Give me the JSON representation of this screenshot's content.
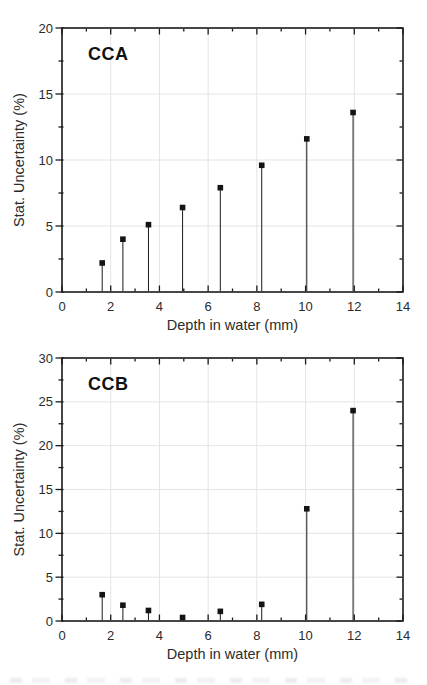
{
  "page": {
    "background": "#ffffff"
  },
  "chart_data": [
    {
      "type": "scatter",
      "subtype": "stem",
      "title": "CCA",
      "xlabel": "Depth in water (mm)",
      "ylabel": "Stat. Uncertainty (%)",
      "xlim": [
        0,
        14
      ],
      "ylim": [
        0,
        20
      ],
      "xticks": [
        0,
        2,
        4,
        6,
        8,
        10,
        12,
        14
      ],
      "yticks": [
        0,
        5,
        10,
        15,
        20
      ],
      "x_minor_step": 1,
      "y_minor_step": 2.5,
      "grid": true,
      "legend": "none",
      "marker": "square",
      "x": [
        1.65,
        2.5,
        3.55,
        4.95,
        6.5,
        8.2,
        10.05,
        11.95
      ],
      "y": [
        2.2,
        4.0,
        5.1,
        6.4,
        7.9,
        9.6,
        11.6,
        13.6
      ],
      "colors": {
        "marker": "#141414",
        "stem": "#1a1a1a",
        "axis": "#1a1a1a",
        "grid": "#e4e4e4",
        "text": "#2b2b2b",
        "title": "#111111"
      }
    },
    {
      "type": "scatter",
      "subtype": "stem",
      "title": "CCB",
      "xlabel": "Depth in water (mm)",
      "ylabel": "Stat. Uncertainty (%)",
      "xlim": [
        0,
        14
      ],
      "ylim": [
        0,
        30
      ],
      "xticks": [
        0,
        2,
        4,
        6,
        8,
        10,
        12,
        14
      ],
      "yticks": [
        0,
        5,
        10,
        15,
        20,
        25,
        30
      ],
      "x_minor_step": 1,
      "y_minor_step": 2.5,
      "grid": true,
      "legend": "none",
      "marker": "square",
      "x": [
        1.65,
        2.5,
        3.55,
        4.95,
        6.5,
        8.2,
        10.05,
        11.95
      ],
      "y": [
        3.0,
        1.8,
        1.2,
        0.4,
        1.1,
        1.9,
        12.8,
        24.0
      ],
      "colors": {
        "marker": "#141414",
        "stem": "#1a1a1a",
        "axis": "#1a1a1a",
        "grid": "#e4e4e4",
        "text": "#2b2b2b",
        "title": "#111111"
      }
    }
  ]
}
